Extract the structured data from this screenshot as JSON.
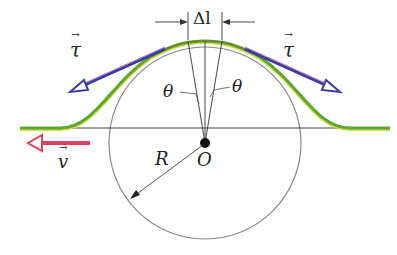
{
  "labels": {
    "delta_l": "Δl",
    "tau_left": "τ",
    "tau_right": "τ",
    "theta_left": "θ",
    "theta_right": "θ",
    "v": "v",
    "R": "R",
    "O": "O"
  },
  "colors": {
    "string_green": "#5aa832",
    "string_yellow": "#d8d84a",
    "tension_blue": "#3a3aa0",
    "tension_purple": "#8a3a9a",
    "velocity_red": "#e04060",
    "circle_gray": "#777777",
    "line_dark": "#333333"
  },
  "geometry": {
    "center": [
      205,
      143
    ],
    "radius": 96,
    "baseline_y": 128
  }
}
